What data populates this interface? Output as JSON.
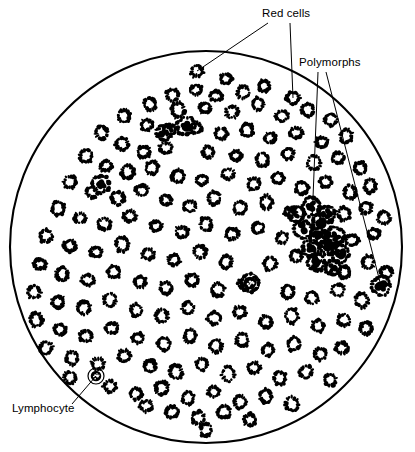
{
  "figure": {
    "name": "blood-smear-micrograph-diagram",
    "background_color": "#ffffff",
    "ink_color": "#000000",
    "field": {
      "shape": "circle",
      "center_x": 206,
      "center_y": 247,
      "radius": 196,
      "stroke_width": 2.1
    }
  },
  "labels": [
    {
      "id": "red-cells",
      "text": "Red cells",
      "x": 262,
      "y": 17,
      "anchor": "start",
      "leaders": [
        {
          "x1": 268,
          "y1": 23,
          "x2": 197,
          "y2": 71
        },
        {
          "x1": 290,
          "y1": 23,
          "x2": 293,
          "y2": 98
        }
      ]
    },
    {
      "id": "polymorphs",
      "text": "Polymorphs",
      "x": 299,
      "y": 66,
      "anchor": "start",
      "leaders": [
        {
          "x1": 318,
          "y1": 72,
          "x2": 311,
          "y2": 248
        },
        {
          "x1": 326,
          "y1": 72,
          "x2": 381,
          "y2": 286
        }
      ]
    },
    {
      "id": "lymphocyte",
      "text": "Lymphocyte",
      "x": 12,
      "y": 412,
      "anchor": "start",
      "leaders": [
        {
          "x1": 72,
          "y1": 404,
          "x2": 96,
          "y2": 376
        }
      ]
    }
  ],
  "cell_types": {
    "red_cell": {
      "label": "Red cells",
      "appearance": "small stippled ring / biconcave disc outline",
      "typical_radius": 6.0,
      "count": 152
    },
    "polymorph": {
      "label": "Polymorphs",
      "appearance": "dark irregular multi-lobed nucleus inside a stippled cytoplasm halo",
      "typical_radius": 8.5,
      "count": 17
    },
    "lymphocyte": {
      "label": "Lymphocyte",
      "appearance": "dense round dark nucleus with thin clear cytoplasm rim, outlined",
      "typical_radius": 8.0,
      "count": 2
    }
  },
  "chart_data": {
    "type": "scatter",
    "xlabel": "",
    "ylabel": "",
    "xlim": [
      0,
      415
    ],
    "ylim": [
      0,
      452
    ],
    "grid": false,
    "legend": [
      "Red cells",
      "Polymorphs",
      "Lymphocyte"
    ],
    "series": [
      {
        "name": "Red cells",
        "marker": "stippled-ring",
        "points": [
          [
            197,
            71,
            6.0
          ],
          [
            226,
            79,
            5.6
          ],
          [
            293,
            98,
            6.2
          ],
          [
            264,
            86,
            5.4
          ],
          [
            172,
            95,
            6.0
          ],
          [
            196,
            90,
            5.5
          ],
          [
            216,
            96,
            6.1
          ],
          [
            243,
            92,
            5.7
          ],
          [
            150,
            104,
            5.8
          ],
          [
            178,
            110,
            6.2
          ],
          [
            205,
            108,
            5.6
          ],
          [
            232,
            112,
            6.0
          ],
          [
            258,
            104,
            5.5
          ],
          [
            282,
            116,
            6.1
          ],
          [
            308,
            110,
            5.8
          ],
          [
            331,
            120,
            5.6
          ],
          [
            124,
            116,
            6.0
          ],
          [
            147,
            125,
            5.7
          ],
          [
            170,
            130,
            6.2
          ],
          [
            196,
            128,
            5.5
          ],
          [
            221,
            134,
            6.0
          ],
          [
            247,
            130,
            5.8
          ],
          [
            270,
            138,
            5.6
          ],
          [
            296,
            133,
            6.1
          ],
          [
            322,
            142,
            5.7
          ],
          [
            346,
            136,
            5.9
          ],
          [
            102,
            133,
            5.8
          ],
          [
            122,
            144,
            6.0
          ],
          [
            144,
            152,
            5.6
          ],
          [
            166,
            148,
            6.1
          ],
          [
            208,
            152,
            5.8
          ],
          [
            236,
            156,
            5.5
          ],
          [
            262,
            160,
            6.0
          ],
          [
            288,
            154,
            5.7
          ],
          [
            314,
            163,
            6.1
          ],
          [
            338,
            158,
            5.6
          ],
          [
            360,
            168,
            5.9
          ],
          [
            86,
            156,
            6.0
          ],
          [
            106,
            166,
            5.6
          ],
          [
            128,
            172,
            6.1
          ],
          [
            152,
            168,
            5.7
          ],
          [
            178,
            176,
            5.9
          ],
          [
            202,
            180,
            5.6
          ],
          [
            228,
            174,
            6.0
          ],
          [
            254,
            184,
            5.8
          ],
          [
            278,
            178,
            5.5
          ],
          [
            302,
            188,
            6.1
          ],
          [
            326,
            182,
            5.7
          ],
          [
            350,
            192,
            5.9
          ],
          [
            370,
            186,
            5.6
          ],
          [
            70,
            182,
            6.0
          ],
          [
            92,
            192,
            5.7
          ],
          [
            118,
            198,
            6.1
          ],
          [
            142,
            190,
            5.8
          ],
          [
            166,
            200,
            5.5
          ],
          [
            190,
            206,
            6.0
          ],
          [
            214,
            198,
            5.7
          ],
          [
            240,
            208,
            6.1
          ],
          [
            266,
            202,
            5.8
          ],
          [
            290,
            212,
            5.6
          ],
          [
            344,
            214,
            6.0
          ],
          [
            366,
            208,
            5.7
          ],
          [
            384,
            218,
            5.9
          ],
          [
            58,
            208,
            6.0
          ],
          [
            80,
            218,
            5.6
          ],
          [
            104,
            224,
            6.1
          ],
          [
            130,
            216,
            5.8
          ],
          [
            156,
            226,
            5.5
          ],
          [
            182,
            232,
            6.0
          ],
          [
            206,
            224,
            5.7
          ],
          [
            232,
            234,
            6.1
          ],
          [
            258,
            228,
            5.8
          ],
          [
            282,
            238,
            5.6
          ],
          [
            352,
            240,
            6.0
          ],
          [
            374,
            234,
            5.7
          ],
          [
            46,
            236,
            5.9
          ],
          [
            70,
            246,
            6.0
          ],
          [
            96,
            252,
            5.6
          ],
          [
            122,
            244,
            6.1
          ],
          [
            148,
            254,
            5.8
          ],
          [
            174,
            260,
            5.5
          ],
          [
            200,
            252,
            6.0
          ],
          [
            226,
            262,
            5.7
          ],
          [
            270,
            264,
            6.1
          ],
          [
            296,
            256,
            5.8
          ],
          [
            320,
            266,
            5.6
          ],
          [
            344,
            272,
            6.0
          ],
          [
            368,
            262,
            5.7
          ],
          [
            386,
            272,
            5.9
          ],
          [
            40,
            264,
            6.0
          ],
          [
            62,
            274,
            5.6
          ],
          [
            88,
            280,
            6.1
          ],
          [
            114,
            272,
            5.8
          ],
          [
            140,
            282,
            5.5
          ],
          [
            166,
            288,
            6.0
          ],
          [
            192,
            280,
            5.7
          ],
          [
            218,
            290,
            6.1
          ],
          [
            244,
            284,
            5.8
          ],
          [
            288,
            292,
            5.6
          ],
          [
            312,
            298,
            6.0
          ],
          [
            338,
            290,
            5.7
          ],
          [
            362,
            300,
            5.9
          ],
          [
            34,
            292,
            6.0
          ],
          [
            58,
            302,
            5.6
          ],
          [
            84,
            308,
            6.1
          ],
          [
            110,
            300,
            5.8
          ],
          [
            136,
            310,
            5.5
          ],
          [
            162,
            316,
            6.0
          ],
          [
            188,
            308,
            5.7
          ],
          [
            214,
            318,
            6.1
          ],
          [
            240,
            312,
            5.8
          ],
          [
            266,
            322,
            5.6
          ],
          [
            292,
            316,
            6.0
          ],
          [
            318,
            326,
            5.7
          ],
          [
            344,
            320,
            5.9
          ],
          [
            366,
            328,
            5.6
          ],
          [
            36,
            320,
            6.0
          ],
          [
            60,
            330,
            5.6
          ],
          [
            86,
            336,
            6.1
          ],
          [
            112,
            328,
            5.8
          ],
          [
            138,
            338,
            5.5
          ],
          [
            164,
            344,
            6.0
          ],
          [
            190,
            336,
            5.7
          ],
          [
            216,
            346,
            6.1
          ],
          [
            242,
            340,
            5.8
          ],
          [
            268,
            350,
            5.6
          ],
          [
            294,
            344,
            6.0
          ],
          [
            320,
            354,
            5.7
          ],
          [
            342,
            348,
            5.9
          ],
          [
            46,
            348,
            6.0
          ],
          [
            72,
            358,
            5.6
          ],
          [
            98,
            364,
            6.1
          ],
          [
            124,
            356,
            5.8
          ],
          [
            150,
            366,
            5.5
          ],
          [
            176,
            372,
            6.0
          ],
          [
            202,
            364,
            5.7
          ],
          [
            228,
            374,
            6.1
          ],
          [
            254,
            368,
            5.8
          ],
          [
            280,
            378,
            5.6
          ],
          [
            306,
            372,
            6.0
          ],
          [
            330,
            380,
            5.7
          ],
          [
            70,
            378,
            5.9
          ],
          [
            110,
            386,
            6.0
          ],
          [
            136,
            394,
            5.6
          ],
          [
            162,
            388,
            6.1
          ],
          [
            188,
            398,
            5.8
          ],
          [
            214,
            392,
            5.5
          ],
          [
            240,
            402,
            6.0
          ],
          [
            266,
            396,
            5.7
          ],
          [
            292,
            404,
            6.1
          ],
          [
            172,
            412,
            5.8
          ],
          [
            198,
            418,
            5.6
          ],
          [
            224,
            412,
            6.0
          ],
          [
            250,
            420,
            5.7
          ],
          [
            146,
            406,
            5.9
          ],
          [
            206,
            430,
            5.6
          ]
        ]
      },
      {
        "name": "Polymorphs",
        "marker": "dark-lobed-blob",
        "points": [
          [
            186,
            126,
            9.0
          ],
          [
            101,
            184,
            8.6
          ],
          [
            311,
            207,
            8.8
          ],
          [
            322,
            224,
            9.2
          ],
          [
            329,
            245,
            9.0
          ],
          [
            311,
            248,
            8.4
          ],
          [
            336,
            236,
            8.2
          ],
          [
            318,
            236,
            8.0
          ],
          [
            381,
            286,
            9.0
          ],
          [
            327,
            214,
            8.0
          ],
          [
            340,
            254,
            8.4
          ],
          [
            303,
            229,
            8.6
          ],
          [
            250,
            283,
            8.2
          ],
          [
            296,
            214,
            7.8
          ],
          [
            316,
            262,
            8.0
          ],
          [
            333,
            268,
            7.6
          ],
          [
            164,
            133,
            7.4
          ]
        ]
      },
      {
        "name": "Lymphocyte",
        "marker": "outlined-dark-nucleus",
        "points": [
          [
            96,
            376,
            8.0
          ],
          [
            250,
            283,
            9.5
          ]
        ]
      }
    ]
  }
}
